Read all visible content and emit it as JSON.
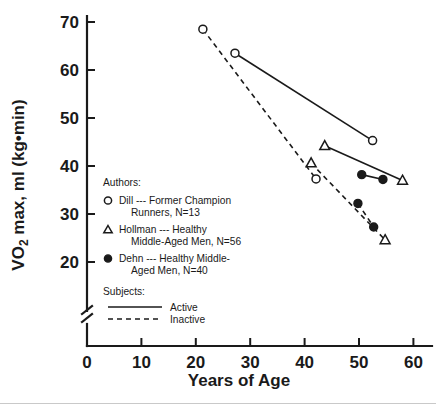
{
  "chart_data": {
    "type": "scatter",
    "title": "",
    "xlabel": "Years of Age",
    "ylabel": "VO2 max, ml (kg•min)",
    "ylabel_main": "VO",
    "ylabel_sub": "2",
    "ylabel_rest": " max, ml (kg•min)",
    "xlim": [
      0,
      62
    ],
    "ylim": [
      17,
      72
    ],
    "xticks": [
      0,
      10,
      20,
      30,
      40,
      50,
      60
    ],
    "yticks": [
      20,
      30,
      40,
      50,
      60,
      70
    ],
    "grid": false,
    "axis_break_x": true,
    "axis_break_y": true,
    "legend_position": "inside-left",
    "series": [
      {
        "name": "Dill --- Former Champion Runners, N=13 (Active)",
        "author": "Dill",
        "subject_type": "Active",
        "marker": "open-circle",
        "line": "solid",
        "points": [
          [
            27.2,
            63.5
          ],
          [
            52.5,
            45.3
          ]
        ]
      },
      {
        "name": "Dill --- Former Champion Runners, N=13 (Inactive)",
        "author": "Dill",
        "subject_type": "Inactive",
        "marker": "open-circle",
        "line": "dashed",
        "points": [
          [
            21.3,
            68.5
          ],
          [
            42.1,
            37.3
          ]
        ]
      },
      {
        "name": "Hollman --- Healthy Middle-Aged Men, N=56 (Active)",
        "author": "Hollman",
        "subject_type": "Active",
        "marker": "open-triangle",
        "line": "solid",
        "points": [
          [
            43.7,
            44.2
          ],
          [
            58.0,
            37.0
          ]
        ]
      },
      {
        "name": "Hollman --- Healthy Middle-Aged Men, N=56 (Inactive)",
        "author": "Hollman",
        "subject_type": "Inactive",
        "marker": "open-triangle",
        "line": "dashed",
        "points": [
          [
            41.2,
            40.6
          ],
          [
            54.8,
            24.6
          ]
        ]
      },
      {
        "name": "Dehn --- Healthy Middle-Aged Men, N=40 (Active)",
        "author": "Dehn",
        "subject_type": "Active",
        "marker": "filled-circle",
        "line": "solid",
        "points": [
          [
            50.5,
            38.2
          ],
          [
            54.4,
            37.2
          ]
        ]
      },
      {
        "name": "Dehn --- Healthy Middle-Aged Men, N=40 (Inactive)",
        "author": "Dehn",
        "subject_type": "Inactive",
        "marker": "filled-circle",
        "line": "dashed",
        "points": [
          [
            49.8,
            32.2
          ],
          [
            52.7,
            27.3
          ]
        ]
      }
    ]
  },
  "legend": {
    "authors_heading": "Authors:",
    "entries": [
      {
        "marker": "open-circle",
        "line1": "Dill --- Former Champion",
        "line2": "Runners, N=13"
      },
      {
        "marker": "open-triangle",
        "line1": "Hollman --- Healthy",
        "line2": "Middle-Aged Men, N=56"
      },
      {
        "marker": "filled-circle",
        "line1": "Dehn --- Healthy Middle-",
        "line2": "Aged Men, N=40"
      }
    ],
    "subjects_heading": "Subjects:",
    "subjects": [
      {
        "style": "solid",
        "label": "Active"
      },
      {
        "style": "dashed",
        "label": "Inactive"
      }
    ]
  },
  "axis": {
    "x_ticklabels": [
      "0",
      "10",
      "20",
      "30",
      "40",
      "50",
      "60"
    ],
    "y_ticklabels": [
      "20",
      "30",
      "40",
      "50",
      "60",
      "70"
    ],
    "x_title": "Years of Age",
    "y_title_main": "VO",
    "y_title_sub": "2",
    "y_title_rest": " max, ml (kg•min)"
  },
  "colors": {
    "ink": "#1a1a1a",
    "background": "#ffffff",
    "rule": "#c9c9c9"
  }
}
